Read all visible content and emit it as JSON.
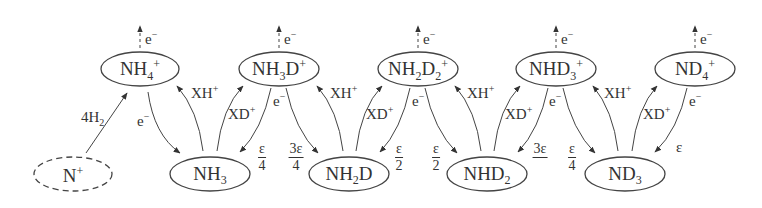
{
  "diagram": {
    "type": "reaction-network",
    "top_nodes": [
      {
        "id": "NH4+",
        "base": "NH",
        "sub": "4",
        "tail": "",
        "sup": "+"
      },
      {
        "id": "NH3D+",
        "base": "NH",
        "sub": "3",
        "tail": "D",
        "sup": "+"
      },
      {
        "id": "NH2D2+",
        "base": "NH",
        "sub": "2",
        "tail": "D",
        "sub2": "2",
        "sup": "+"
      },
      {
        "id": "NHD3+",
        "base": "NHD",
        "sub": "3",
        "tail": "",
        "sup": "+"
      },
      {
        "id": "ND4+",
        "base": "ND",
        "sub": "4",
        "tail": "",
        "sup": "+"
      }
    ],
    "bottom_nodes": [
      {
        "id": "N+",
        "base": "N",
        "sup": "+",
        "dashed": true
      },
      {
        "id": "NH3",
        "base": "NH",
        "sub": "3"
      },
      {
        "id": "NH2D",
        "base": "NH",
        "sub": "2",
        "tail": "D"
      },
      {
        "id": "NHD2",
        "base": "NHD",
        "sub": "2"
      },
      {
        "id": "ND3",
        "base": "ND",
        "sub": "3"
      }
    ],
    "labels": {
      "electron": "e",
      "electron_sup": "−",
      "xh": "XH",
      "xd": "XD",
      "plus": "+",
      "h2_coef": "4H",
      "h2_sub": "2",
      "eps": "ε"
    },
    "branching_fractions": [
      {
        "num": "ε",
        "den": "4"
      },
      {
        "num": "3ε",
        "den": "4"
      },
      {
        "num": "ε",
        "den": "2"
      },
      {
        "num": "ε",
        "den": "2"
      },
      {
        "num": "3ε",
        "den": "4"
      },
      {
        "num": "ε",
        "den": "4"
      }
    ],
    "final_branch": "ε"
  }
}
